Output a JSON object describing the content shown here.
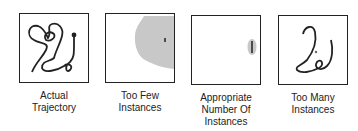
{
  "panels": [
    {
      "label_lines": [
        "Actual",
        "Trajectory"
      ],
      "icon": "trajectory-curve"
    },
    {
      "label_lines": [
        "Too Few",
        "Instances"
      ],
      "icon": "large-gray-region"
    },
    {
      "label_lines": [
        "Appropriate",
        "Number Of",
        "Instances"
      ],
      "icon": "small-gray-ellipse"
    },
    {
      "label_lines": [
        "Too Many",
        "Instances"
      ],
      "icon": "overfit-curve"
    }
  ],
  "colors": {
    "stroke": "#222222",
    "shade": "#c8c8c8"
  }
}
